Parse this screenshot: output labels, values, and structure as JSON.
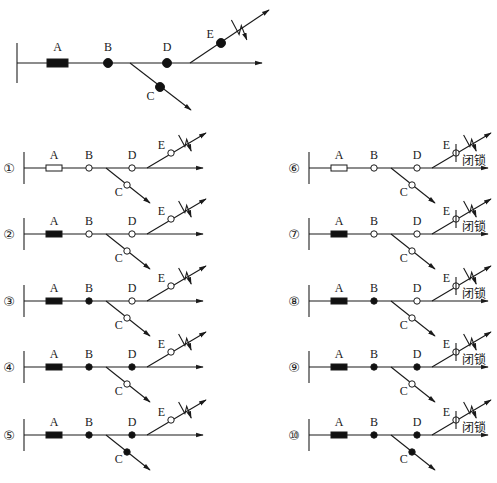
{
  "legend": {
    "labels": {
      "A": "A",
      "B": "B",
      "C": "C",
      "D": "D",
      "E": "E"
    },
    "lock_text": "闭锁"
  },
  "main_diagram": {
    "states": {
      "A": "closed",
      "B": "closed",
      "C": "closed",
      "D": "closed",
      "E": "closed"
    }
  },
  "scenarios": [
    {
      "id": 1,
      "number": "①",
      "column": "left",
      "A": "open",
      "B": "open",
      "C": "open",
      "D": "open",
      "E": "open",
      "E_locked": false
    },
    {
      "id": 2,
      "number": "②",
      "column": "left",
      "A": "closed",
      "B": "open",
      "C": "open",
      "D": "open",
      "E": "open",
      "E_locked": false
    },
    {
      "id": 3,
      "number": "③",
      "column": "left",
      "A": "closed",
      "B": "closed",
      "C": "open",
      "D": "open",
      "E": "open",
      "E_locked": false
    },
    {
      "id": 4,
      "number": "④",
      "column": "left",
      "A": "closed",
      "B": "closed",
      "C": "open",
      "D": "closed",
      "E": "open",
      "E_locked": false
    },
    {
      "id": 5,
      "number": "⑤",
      "column": "left",
      "A": "closed",
      "B": "closed",
      "C": "closed",
      "D": "closed",
      "E": "open",
      "E_locked": false
    },
    {
      "id": 6,
      "number": "⑥",
      "column": "right",
      "A": "open",
      "B": "open",
      "C": "open",
      "D": "open",
      "E": "open",
      "E_locked": true
    },
    {
      "id": 7,
      "number": "⑦",
      "column": "right",
      "A": "closed",
      "B": "open",
      "C": "open",
      "D": "open",
      "E": "open",
      "E_locked": true
    },
    {
      "id": 8,
      "number": "⑧",
      "column": "right",
      "A": "closed",
      "B": "closed",
      "C": "open",
      "D": "open",
      "E": "open",
      "E_locked": true
    },
    {
      "id": 9,
      "number": "⑨",
      "column": "right",
      "A": "closed",
      "B": "closed",
      "C": "open",
      "D": "closed",
      "E": "open",
      "E_locked": true
    },
    {
      "id": 10,
      "number": "⑩",
      "column": "right",
      "A": "closed",
      "B": "closed",
      "C": "closed",
      "D": "closed",
      "E": "open",
      "E_locked": true
    }
  ]
}
